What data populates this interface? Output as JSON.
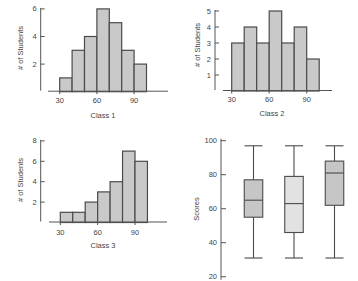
{
  "colors": {
    "bar_fill": "#c9c9c9",
    "bar_stroke": "#4a4a4a",
    "box_fill_dark": "#c6c6c6",
    "box_fill_light": "#e2e2e2",
    "axis": "#555555",
    "text": "#444444"
  },
  "chart_data": [
    {
      "id": "class1",
      "type": "bar",
      "subtype": "histogram",
      "title": "",
      "xlabel": "Class 1",
      "ylabel": "# of Students",
      "bin_edges": [
        30,
        40,
        50,
        60,
        70,
        80,
        90,
        100
      ],
      "categories": [
        "30-40",
        "40-50",
        "50-60",
        "60-70",
        "70-80",
        "80-90",
        "90-100"
      ],
      "values": [
        1,
        3,
        4,
        6,
        5,
        3,
        2
      ],
      "xticks": [
        30,
        60,
        90
      ],
      "yticks": [
        2,
        4,
        6
      ],
      "ylim": [
        0,
        6
      ],
      "grid": false
    },
    {
      "id": "class2",
      "type": "bar",
      "subtype": "histogram",
      "title": "",
      "xlabel": "Class 2",
      "ylabel": "# of Students",
      "bin_edges": [
        30,
        40,
        50,
        60,
        70,
        80,
        90,
        100
      ],
      "categories": [
        "30-40",
        "40-50",
        "50-60",
        "60-70",
        "70-80",
        "80-90",
        "90-100"
      ],
      "values": [
        3,
        4,
        3,
        5,
        3,
        4,
        2
      ],
      "xticks": [
        30,
        60,
        90
      ],
      "yticks": [
        1,
        2,
        3,
        4,
        5
      ],
      "ylim": [
        0,
        5
      ],
      "grid": false
    },
    {
      "id": "class3",
      "type": "bar",
      "subtype": "histogram",
      "title": "",
      "xlabel": "Class 3",
      "ylabel": "# of Students",
      "bin_edges": [
        30,
        40,
        50,
        60,
        70,
        80,
        90,
        100
      ],
      "categories": [
        "30-40",
        "40-50",
        "50-60",
        "60-70",
        "70-80",
        "80-90",
        "90-100"
      ],
      "values": [
        1,
        1,
        2,
        3,
        4,
        7,
        6
      ],
      "xticks": [
        30,
        60,
        90
      ],
      "yticks": [
        2,
        4,
        6,
        8
      ],
      "ylim": [
        0,
        8
      ],
      "grid": false
    },
    {
      "id": "boxplots",
      "type": "boxplot",
      "title": "",
      "xlabel": "",
      "ylabel": "Scores",
      "yticks": [
        20,
        40,
        60,
        80,
        100
      ],
      "ylim": [
        20,
        100
      ],
      "grid": false,
      "series": [
        {
          "name": "Box 1",
          "min": 31,
          "q1": 55,
          "median": 65,
          "q3": 77,
          "max": 97,
          "shade": "dark"
        },
        {
          "name": "Box 2",
          "min": 31,
          "q1": 46,
          "median": 63,
          "q3": 79,
          "max": 97,
          "shade": "light"
        },
        {
          "name": "Box 3",
          "min": 31,
          "q1": 62,
          "median": 81,
          "q3": 88,
          "max": 97,
          "shade": "dark"
        }
      ]
    }
  ]
}
